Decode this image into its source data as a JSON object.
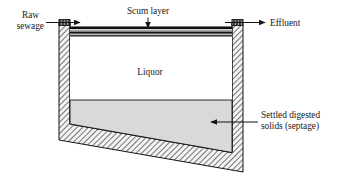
{
  "figure": {
    "type": "cross-section-diagram"
  },
  "labels": {
    "raw_sewage_line1": "Raw",
    "raw_sewage_line2": "sewage",
    "scum_layer": "Scum layer",
    "effluent": "Effluent",
    "liquor": "Liquor",
    "settled_line1": "Settled digested",
    "settled_line2": "solids (septage)"
  },
  "colors": {
    "outline": "#151515",
    "wall_hatch": "#4d4d4d",
    "wall_fill": "#f2f2f2",
    "scum_dark": "#0d0d0d",
    "scum_light": "#d8d8d8",
    "liquor_fill": "#ffffff",
    "sludge_fill": "#d9d9d9",
    "text": "#171717",
    "background": "#ffffff"
  },
  "geometry": {
    "canvas_width": 343,
    "canvas_height": 182,
    "left_wall_x": 59,
    "right_wall_x": 232,
    "wall_thickness": 11,
    "tank_top_y": 23,
    "left_wall_bottom_y": 140,
    "right_wall_bottom_y": 172
  },
  "annotations": [
    {
      "name": "raw-sewage",
      "direction": "right",
      "target": "inlet port, left wall top"
    },
    {
      "name": "scum-layer",
      "direction": "down",
      "target": "dark striped layer below liquid surface"
    },
    {
      "name": "effluent",
      "direction": "right",
      "target": "outlet port, right wall top"
    },
    {
      "name": "settled-digested-solids",
      "direction": "left",
      "target": "grey sludge zone at tank bottom"
    }
  ]
}
